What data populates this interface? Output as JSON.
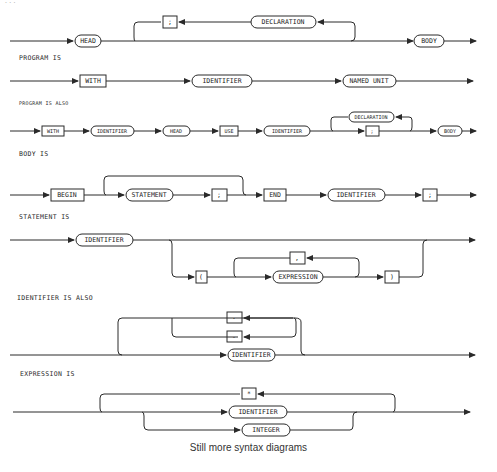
{
  "figure": {
    "top_cutoff_label": "...",
    "caption": "Still more syntax diagrams",
    "ink_color": "#2a2a2a",
    "background": "#ffffff"
  },
  "diagrams": [
    {
      "heading": "",
      "nodes": [
        {
          "label": "HEAD",
          "kind": "nonterminal"
        },
        {
          "label": ";",
          "kind": "terminal"
        },
        {
          "label": "DECLARATION",
          "kind": "nonterminal"
        },
        {
          "label": "BODY",
          "kind": "nonterminal"
        }
      ]
    },
    {
      "heading": "PROGRAM IS",
      "nodes": [
        {
          "label": "WITH",
          "kind": "terminal"
        },
        {
          "label": "IDENTIFIER",
          "kind": "nonterminal"
        },
        {
          "label": "NAMED UNIT",
          "kind": "nonterminal"
        }
      ]
    },
    {
      "heading": "PROGRAM IS ALSO",
      "nodes": [
        {
          "label": "WITH",
          "kind": "terminal"
        },
        {
          "label": "IDENTIFIER",
          "kind": "nonterminal"
        },
        {
          "label": "HEAD",
          "kind": "nonterminal"
        },
        {
          "label": "USE",
          "kind": "terminal"
        },
        {
          "label": "IDENTIFIER",
          "kind": "nonterminal"
        },
        {
          "label": "DECLARATION",
          "kind": "nonterminal"
        },
        {
          "label": ";",
          "kind": "terminal"
        },
        {
          "label": "BODY",
          "kind": "nonterminal"
        }
      ]
    },
    {
      "heading": "BODY IS",
      "nodes": [
        {
          "label": "BEGIN",
          "kind": "terminal"
        },
        {
          "label": "STATEMENT",
          "kind": "nonterminal"
        },
        {
          "label": ";",
          "kind": "terminal"
        },
        {
          "label": "END",
          "kind": "terminal"
        },
        {
          "label": "IDENTIFIER",
          "kind": "nonterminal"
        },
        {
          "label": ";",
          "kind": "terminal"
        }
      ]
    },
    {
      "heading": "STATEMENT IS",
      "nodes": [
        {
          "label": "IDENTIFIER",
          "kind": "nonterminal"
        },
        {
          "label": "(",
          "kind": "terminal"
        },
        {
          "label": ",",
          "kind": "terminal"
        },
        {
          "label": "EXPRESSION",
          "kind": "nonterminal"
        },
        {
          "label": ")",
          "kind": "terminal"
        }
      ]
    },
    {
      "heading": "IDENTIFIER IS ALSO",
      "nodes": [
        {
          "label": ".",
          "kind": "terminal"
        },
        {
          "label": "-",
          "kind": "terminal"
        },
        {
          "label": "IDENTIFIER",
          "kind": "nonterminal"
        }
      ]
    },
    {
      "heading": "EXPRESSION IS",
      "nodes": [
        {
          "label": "*",
          "kind": "terminal"
        },
        {
          "label": "IDENTIFIER",
          "kind": "nonterminal"
        },
        {
          "label": "INTEGER",
          "kind": "nonterminal"
        }
      ]
    }
  ]
}
